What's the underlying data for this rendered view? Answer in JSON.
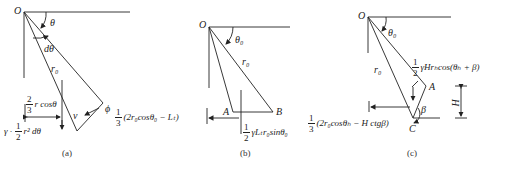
{
  "figures": [
    {
      "id": "a",
      "caption": "(a)",
      "labels": {
        "origin": "O",
        "angle": "θ",
        "dangle": "dθ",
        "radius": "r₀",
        "phi": "ϕ",
        "v": "v",
        "arm_num": "2",
        "arm_den": "3",
        "arm_expr": "r cosθ",
        "weight_prefix": "γ ·",
        "weight_num": "1",
        "weight_den": "2",
        "weight_expr": "r² dθ"
      }
    },
    {
      "id": "b",
      "caption": "(b)",
      "labels": {
        "origin": "O",
        "angle": "θ₀",
        "radius": "r₀",
        "point_a": "A",
        "point_b": "B",
        "arm_num": "1",
        "arm_den": "3",
        "arm_expr": "(2r₀cosθ₀ − Lₜ)",
        "force_num": "1",
        "force_den": "2",
        "force_expr": "γLₜr₀sinθ₀"
      }
    },
    {
      "id": "c",
      "caption": "(c)",
      "labels": {
        "origin": "O",
        "angle": "θ₀",
        "radius": "r₀",
        "point_a": "A",
        "point_c": "C",
        "beta": "β",
        "height": "H",
        "force_num": "1",
        "force_den": "2",
        "force_expr": "γHrₕcos(θₕ + β)",
        "arm_num": "1",
        "arm_den": "3",
        "arm_expr": "(2r₀cosθₕ − H ctgβ)"
      }
    }
  ]
}
